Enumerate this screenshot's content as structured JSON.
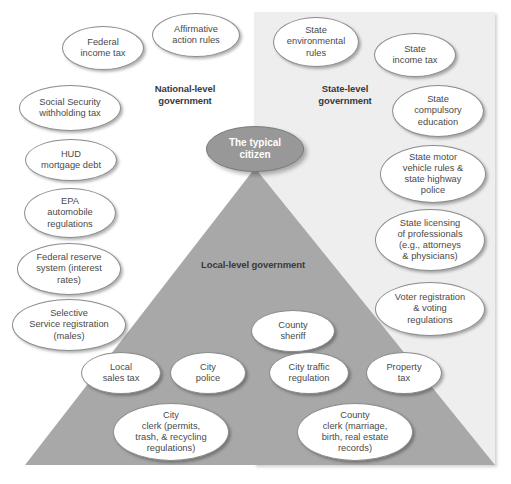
{
  "figure": {
    "center_node": {
      "label": "The typical\ncitizen",
      "fill": "#989898",
      "text_color": "#ffffff"
    },
    "level_labels": {
      "national": "National-level\ngovernment",
      "state": "State-level\ngovernment",
      "local": "Local-level government"
    },
    "colors": {
      "state_panel": "#eeeeee",
      "local_pyramid": "#a8a8a8",
      "node_fill": "#ffffff",
      "node_border": "#8c8c8c",
      "node_text": "#4a4a4a"
    }
  },
  "nodes": {
    "national": [
      {
        "label": "Federal\nincome tax"
      },
      {
        "label": "Affirmative\naction rules"
      },
      {
        "label": "Social Security\nwithholding tax"
      },
      {
        "label": "HUD\nmortgage debt"
      },
      {
        "label": "EPA\nautomobile\nregulations"
      },
      {
        "label": "Federal reserve\nsystem (interest\nrates)"
      },
      {
        "label": "Selective\nService registration\n(males)"
      }
    ],
    "state": [
      {
        "label": "State\nenvironmental\nrules"
      },
      {
        "label": "State\nincome tax"
      },
      {
        "label": "State\ncompulsory\neducation"
      },
      {
        "label": "State motor\nvehicle rules &\nstate highway\npolice"
      },
      {
        "label": "State licensing\nof professionals\n(e.g., attorneys\n& physicians)"
      },
      {
        "label": "Voter registration\n& voting\nregulations"
      }
    ],
    "local": [
      {
        "label": "County\nsheriff"
      },
      {
        "label": "Local\nsales tax"
      },
      {
        "label": "City\npolice"
      },
      {
        "label": "City traffic\nregulation"
      },
      {
        "label": "Property\ntax"
      },
      {
        "label": "City\nclerk (permits,\ntrash, & recycling\nregulations)"
      },
      {
        "label": "County\nclerk (marriage,\nbirth, real estate\nrecords)"
      }
    ]
  }
}
